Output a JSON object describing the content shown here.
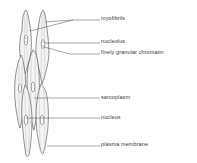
{
  "diagram": {
    "labels": [
      {
        "id": "myofibrils",
        "text": "myofibrils",
        "x": 101,
        "y": 16
      },
      {
        "id": "nucleolus",
        "text": "nucleolus",
        "x": 101,
        "y": 39
      },
      {
        "id": "chromatin",
        "text": "finely granular chromatin",
        "x": 101,
        "y": 50
      },
      {
        "id": "sarcoplasm",
        "text": "sarcoplasm",
        "x": 101,
        "y": 96
      },
      {
        "id": "nucleus",
        "text": "nucleus",
        "x": 101,
        "y": 116
      },
      {
        "id": "plasma-membrane",
        "text": "plasma membrane",
        "x": 101,
        "y": 143
      }
    ],
    "colors": {
      "line": "#4a4a4a",
      "cell_fill": "#f3f3f3",
      "text": "#3a3a3a",
      "background": "#ffffff"
    }
  }
}
